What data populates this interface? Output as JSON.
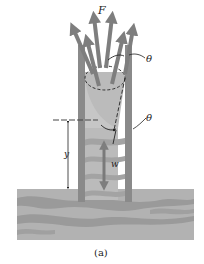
{
  "figure": {
    "caption": "(a)",
    "labels": {
      "force": "F",
      "angle_top": "θ",
      "angle_bottom": "θ",
      "height": "y",
      "weight": "w"
    },
    "colors": {
      "background": "#ffffff",
      "tube_wall": "#8a8a8a",
      "liquid": "#b4b4b4",
      "liquid_band": "#9c9c9c",
      "reservoir": "#b0b0b0",
      "reservoir_band": "#969696",
      "arrow": "#7e7e7e",
      "ink": "#222222"
    }
  }
}
